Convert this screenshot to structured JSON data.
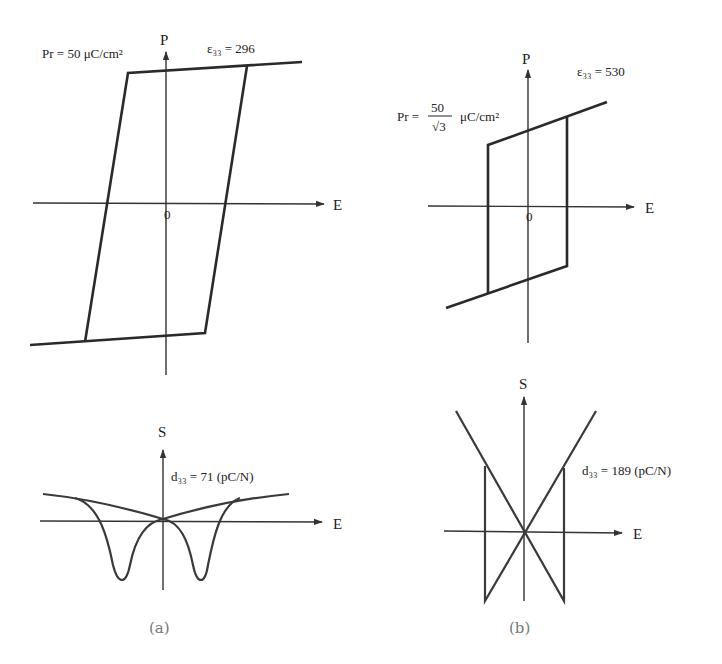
{
  "panels": {
    "a": {
      "caption": "(a)",
      "pe_loop": {
        "y_axis_label": "P",
        "x_axis_label": "E",
        "origin_label": "0",
        "pr_label": "Pr = 50 μC/cm²",
        "eps_label": "ε₃₃ = 296"
      },
      "strain": {
        "y_axis_label": "S",
        "x_axis_label": "E",
        "d33_label": "d₃₃ = 71 (pC/N)"
      }
    },
    "b": {
      "caption": "(b)",
      "pe_loop": {
        "y_axis_label": "P",
        "x_axis_label": "E",
        "origin_label": "0",
        "pr_prefix": "Pr =",
        "pr_num": "50",
        "pr_den": "√3",
        "pr_unit": "μC/cm²",
        "eps_label": "ε₃₃ = 530"
      },
      "strain": {
        "y_axis_label": "S",
        "x_axis_label": "E",
        "d33_label": "d₃₃ = 189 (pC/N)"
      }
    }
  },
  "colors": {
    "line": "#2a2a2a",
    "axis": "#333333",
    "caption": "#777777"
  }
}
